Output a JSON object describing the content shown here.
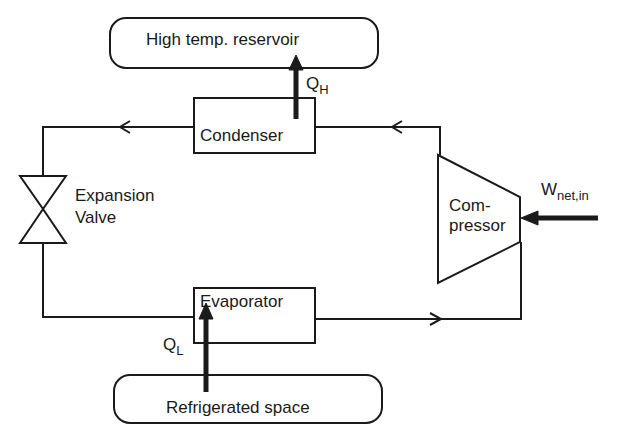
{
  "diagram": {
    "reservoirs": {
      "high": {
        "label": "High temp. reservoir"
      },
      "low": {
        "label": "Refrigerated space"
      }
    },
    "components": {
      "condenser": {
        "label": "Condenser"
      },
      "evaporator": {
        "label": "Evaporator"
      },
      "expansion_valve": {
        "line1": "Expansion",
        "line2": "Valve"
      },
      "compressor": {
        "line1": "Com-",
        "line2": "pressor"
      }
    },
    "flows": {
      "q_high": {
        "main": "Q",
        "sub": "H"
      },
      "q_low": {
        "main": "Q",
        "sub": "L"
      },
      "work_in": {
        "main": "W",
        "sub": "net,in"
      }
    },
    "colors": {
      "stroke": "#1a1a1a",
      "background": "#ffffff"
    }
  }
}
